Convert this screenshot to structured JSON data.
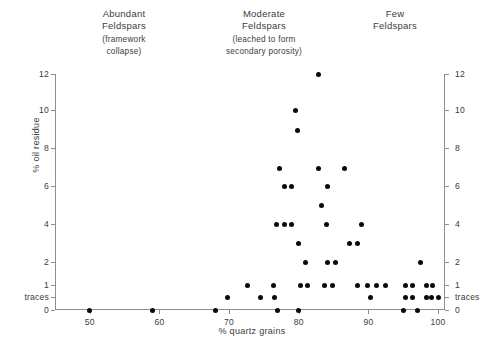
{
  "figure": {
    "x_axis_title": "% quartz grains",
    "y_axis_title": "% oil residue"
  },
  "zones": [
    {
      "title": "Abundant\nFeldspars",
      "line1": "Abundant",
      "line2": "Feldspars",
      "sub1": "(framework",
      "sub2": "collapse)"
    },
    {
      "line1": "Moderate",
      "line2": "Feldspars",
      "sub1": "(leached to form",
      "sub2": "secondary porosity)"
    },
    {
      "line1": "Few",
      "line2": "Feldspars",
      "sub1": "",
      "sub2": ""
    }
  ],
  "chart_data": {
    "type": "scatter",
    "title": "",
    "xlabel": "% quartz grains",
    "ylabel": "% oil residue",
    "xlim": [
      45,
      101
    ],
    "ylim": [
      0,
      12
    ],
    "grid": false,
    "legend": null,
    "xticks": [
      50,
      60,
      70,
      80,
      90,
      100
    ],
    "xtick_labels": [
      "50",
      "60",
      "70",
      "80",
      "90",
      "100"
    ],
    "ytick_labels_left": [
      "0",
      "traces",
      "1",
      "2",
      "4",
      "6",
      "8",
      "10",
      "12"
    ],
    "ytick_labels_right": [
      "0",
      "traces",
      "1",
      "2",
      "4",
      "6",
      "8",
      "10",
      "12"
    ],
    "y_axis_note": "non-linear below 2: 0, traces, 1, 2 are compressed",
    "annotations": [
      "Abundant Feldspars (framework collapse)",
      "Moderate Feldspars (leached to form secondary porosity)",
      "Few Feldspars"
    ],
    "points": [
      {
        "x": 50.0,
        "y": 0
      },
      {
        "x": 59.0,
        "y": 0
      },
      {
        "x": 68.0,
        "y": 0
      },
      {
        "x": 77.0,
        "y": 0
      },
      {
        "x": 80.0,
        "y": 0
      },
      {
        "x": 95.0,
        "y": 0
      },
      {
        "x": 97.0,
        "y": 0
      },
      {
        "x": 69.8,
        "y": "traces"
      },
      {
        "x": 74.5,
        "y": "traces"
      },
      {
        "x": 76.5,
        "y": "traces"
      },
      {
        "x": 90.3,
        "y": "traces"
      },
      {
        "x": 95.3,
        "y": "traces"
      },
      {
        "x": 96.4,
        "y": "traces"
      },
      {
        "x": 98.3,
        "y": "traces"
      },
      {
        "x": 99.1,
        "y": "traces"
      },
      {
        "x": 100.0,
        "y": "traces"
      },
      {
        "x": 72.6,
        "y": 1
      },
      {
        "x": 76.4,
        "y": 1
      },
      {
        "x": 80.3,
        "y": 1
      },
      {
        "x": 81.3,
        "y": 1
      },
      {
        "x": 83.7,
        "y": 1
      },
      {
        "x": 84.8,
        "y": 1
      },
      {
        "x": 88.4,
        "y": 1
      },
      {
        "x": 89.8,
        "y": 1
      },
      {
        "x": 91.2,
        "y": 1
      },
      {
        "x": 92.4,
        "y": 1
      },
      {
        "x": 95.3,
        "y": 1
      },
      {
        "x": 96.4,
        "y": 1
      },
      {
        "x": 98.3,
        "y": 1
      },
      {
        "x": 99.2,
        "y": 1
      },
      {
        "x": 81.0,
        "y": 2
      },
      {
        "x": 84.1,
        "y": 2
      },
      {
        "x": 85.3,
        "y": 2
      },
      {
        "x": 97.5,
        "y": 2
      },
      {
        "x": 79.9,
        "y": 3
      },
      {
        "x": 87.3,
        "y": 3
      },
      {
        "x": 88.5,
        "y": 3
      },
      {
        "x": 76.8,
        "y": 4
      },
      {
        "x": 77.9,
        "y": 4
      },
      {
        "x": 79.0,
        "y": 4
      },
      {
        "x": 84.0,
        "y": 4
      },
      {
        "x": 89.0,
        "y": 4
      },
      {
        "x": 83.3,
        "y": 5
      },
      {
        "x": 78.0,
        "y": 6
      },
      {
        "x": 78.9,
        "y": 6
      },
      {
        "x": 84.1,
        "y": 6
      },
      {
        "x": 77.2,
        "y": 7
      },
      {
        "x": 82.8,
        "y": 7
      },
      {
        "x": 86.5,
        "y": 7
      },
      {
        "x": 79.8,
        "y": 9
      },
      {
        "x": 79.6,
        "y": 10
      },
      {
        "x": 82.8,
        "y": 12
      }
    ]
  }
}
